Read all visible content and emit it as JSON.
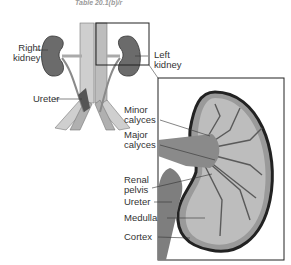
{
  "caption": "Table 20.1(b)/r",
  "overview_labels": {
    "right_kidney": [
      "Right",
      "kidney"
    ],
    "left_kidney": [
      "Left",
      "kidney"
    ],
    "ureter": "Ureter"
  },
  "detail_labels": {
    "minor_calyces": [
      "Minor",
      "calyces"
    ],
    "major_calyces": [
      "Major",
      "calyces"
    ],
    "renal_pelvis": [
      "Renal",
      "pelvis"
    ],
    "ureter": "Ureter",
    "medulla": "Medulla",
    "cortex": "Cortex"
  },
  "colors": {
    "kidney_fill": "#6b6b6b",
    "outline": "#222222",
    "vessel": "#c8c8c8"
  }
}
